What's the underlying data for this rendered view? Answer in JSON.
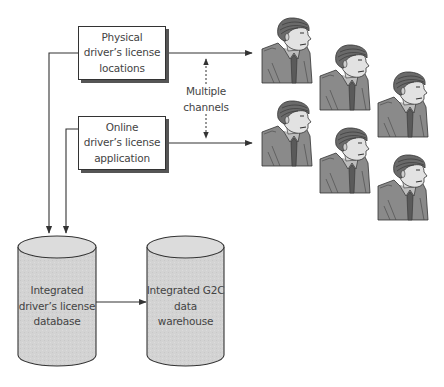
{
  "diagram": {
    "boxes": [
      {
        "id": "physical",
        "lines": [
          "Physical",
          "driver’s license",
          "locations"
        ]
      },
      {
        "id": "online",
        "lines": [
          "Online",
          "driver’s license",
          "application"
        ]
      }
    ],
    "channels_label": [
      "Multiple",
      "channels"
    ],
    "databases": [
      {
        "id": "license-db",
        "lines": [
          "Integrated",
          "driver’s license",
          "database"
        ]
      },
      {
        "id": "warehouse",
        "lines": [
          "Integrated G2C",
          "data",
          "warehouse"
        ]
      }
    ],
    "citizens": {
      "count": 6,
      "icon": "person-icon"
    },
    "colors": {
      "line": "#333333",
      "cylinder_fill": "#d4d4d4",
      "box_shadow": "#555555",
      "person_dark": "#555555",
      "person_mid": "#8a8a8a",
      "person_light": "#cfcfcf"
    }
  }
}
